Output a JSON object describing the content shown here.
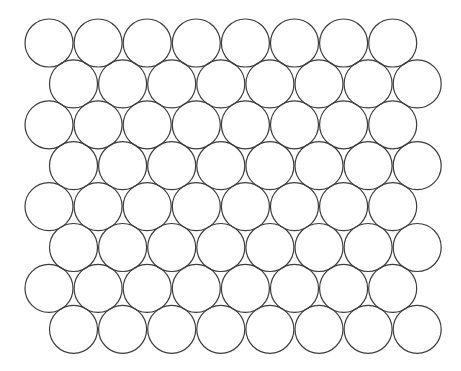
{
  "diagram": {
    "title": "",
    "rows": 8,
    "columns_per_row": 8,
    "radius": 24,
    "column_spacing": 49.1,
    "row_spacing": 40.9,
    "even_row_start": {
      "x": 49,
      "y": 43
    },
    "odd_row_offset_x": 24.5,
    "stroke_color": "#3c3c3c",
    "fill_color": "#ffffff",
    "background_color": "#ffffff"
  }
}
